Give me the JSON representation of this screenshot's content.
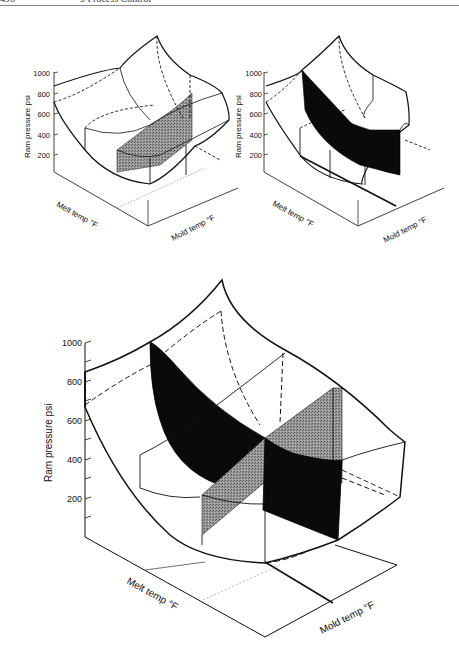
{
  "header": {
    "page_number": "496",
    "chapter": "9  Process Control"
  },
  "figures": [
    {
      "id": "top-left",
      "y_axis_label": "Ram pressure psi",
      "y_ticks": [
        "1000",
        "800",
        "600",
        "400",
        "200"
      ],
      "x_axis_left_label": "Melt temp °F",
      "x_axis_right_label": "Mold temp °F",
      "shaded_region": "gray vertical slice (constant mold temp)"
    },
    {
      "id": "top-right",
      "y_axis_label": "Ram pressure psi",
      "y_ticks": [
        "1000",
        "800",
        "600",
        "400",
        "200"
      ],
      "x_axis_left_label": "Melt temp °F",
      "x_axis_right_label": "Mold temp °F",
      "shaded_region": "black vertical slice (constant melt temp)"
    },
    {
      "id": "bottom-large",
      "y_axis_label": "Ram pressure psi",
      "y_ticks": [
        "1000",
        "800",
        "600",
        "400",
        "200"
      ],
      "x_axis_left_label": "Melt temp °F",
      "x_axis_right_label": "Mold temp °F",
      "shaded_region": "intersecting black and gray slices"
    }
  ],
  "colors": {
    "line": "#111111",
    "black_slice": "#0a0a0a",
    "gray_slice": "#8a8a8a"
  }
}
